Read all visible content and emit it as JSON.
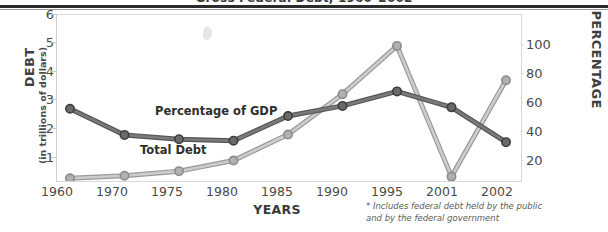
{
  "title": "Gross Federal Debt, 1960–2002",
  "axis": {
    "y_left_title": "DEBT",
    "y_left_subtitle": "(in trillions of dollars)",
    "y_right_title": "PERCENTAGE",
    "x_title": "YEARS"
  },
  "footnote": {
    "line1": "* Includes federal debt held by the public",
    "line2": "and by the federal government"
  },
  "series_labels": {
    "gdp": "Percentage of GDP",
    "debt": "Total Debt"
  },
  "colors": {
    "gdp_line": "#6b6b6b",
    "gdp_marker": "#5a5a5a",
    "debt_line": "#b5b5b5",
    "debt_marker": "#9e9e9e",
    "axis": "#d8d8d8",
    "text": "#4a4a4a",
    "rule": "#2b2b2b"
  },
  "chart_data": {
    "type": "line",
    "title": "Gross Federal Debt, 1960–2002",
    "xlabel": "YEARS",
    "ylabel": "DEBT (in trillions of dollars)",
    "y2label": "PERCENTAGE",
    "grid": false,
    "legend": "inline-labels",
    "categories": [
      "1960",
      "1970",
      "1975",
      "1980",
      "1985",
      "1990",
      "1995",
      "2001",
      "2002"
    ],
    "x_tick_labels": [
      "1960",
      "1970",
      "1975",
      "1980",
      "1985",
      "1990",
      "1995",
      "2001",
      "2002"
    ],
    "y_tick_labels": [
      "1",
      "2",
      "3",
      "4",
      "5",
      "6"
    ],
    "y2_tick_labels": [
      "20",
      "40",
      "60",
      "80",
      "100"
    ],
    "ylim": [
      0,
      6
    ],
    "y2lim": [
      0,
      120
    ],
    "series": [
      {
        "name": "Percentage of GDP",
        "axis": "right",
        "unit": "percent",
        "color": "#6b6b6b",
        "values": [
          56,
          38,
          35,
          34,
          51,
          58,
          68,
          57,
          33
        ]
      },
      {
        "name": "Total Debt",
        "axis": "left",
        "unit": "trillions of dollars",
        "color": "#b5b5b5",
        "values": [
          0.29,
          0.38,
          0.54,
          0.91,
          1.82,
          3.23,
          4.92,
          0.35,
          3.72
        ]
      }
    ],
    "annotations": [
      "* Includes federal debt held by the public",
      "and by the federal government"
    ]
  }
}
